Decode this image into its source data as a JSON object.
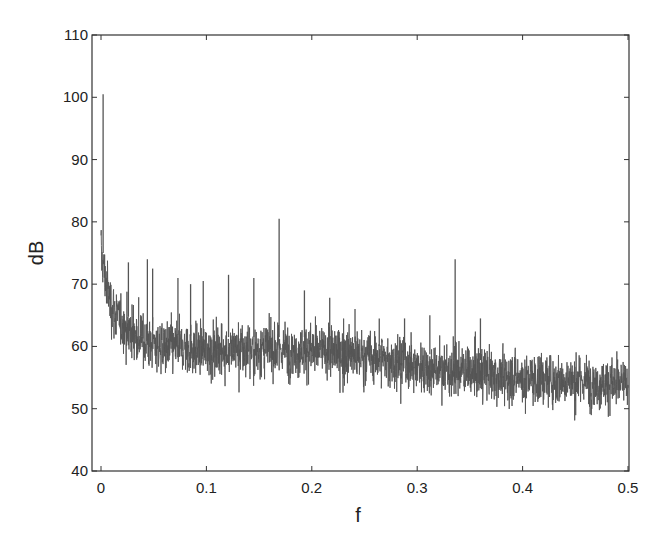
{
  "chart_data": {
    "type": "line",
    "title": "",
    "xlabel": "f",
    "ylabel": "dB",
    "xlim": [
      0,
      0.5
    ],
    "ylim": [
      40,
      110
    ],
    "grid": false,
    "legend": null,
    "x_ticks": [
      "0",
      "0.1",
      "0.2",
      "0.3",
      "0.4",
      "0.5"
    ],
    "y_ticks": [
      "40",
      "50",
      "60",
      "70",
      "80",
      "90",
      "100",
      "110"
    ],
    "line_color": "#555555",
    "baseline_trend": {
      "f": [
        0.0,
        0.005,
        0.01,
        0.02,
        0.04,
        0.06,
        0.1,
        0.15,
        0.2,
        0.25,
        0.3,
        0.35,
        0.4,
        0.45,
        0.5
      ],
      "center_db": [
        75,
        70,
        66.5,
        63.5,
        61,
        60,
        59.5,
        59.5,
        59.5,
        58.5,
        57,
        56,
        55,
        54.5,
        54
      ],
      "spread_db": [
        4,
        4,
        4,
        4,
        4,
        4,
        4,
        4,
        4,
        4,
        3.8,
        3.8,
        3.8,
        3.8,
        3.8
      ]
    },
    "peaks": [
      {
        "f": 0.002,
        "db": 100.5
      },
      {
        "f": 0.026,
        "db": 73.5
      },
      {
        "f": 0.044,
        "db": 74.0
      },
      {
        "f": 0.049,
        "db": 72.5
      },
      {
        "f": 0.073,
        "db": 71.0
      },
      {
        "f": 0.085,
        "db": 70.0
      },
      {
        "f": 0.097,
        "db": 70.5
      },
      {
        "f": 0.121,
        "db": 71.5
      },
      {
        "f": 0.145,
        "db": 71.0
      },
      {
        "f": 0.169,
        "db": 80.5
      },
      {
        "f": 0.193,
        "db": 69.0
      },
      {
        "f": 0.217,
        "db": 67.8
      },
      {
        "f": 0.241,
        "db": 66.0
      },
      {
        "f": 0.264,
        "db": 64.5
      },
      {
        "f": 0.288,
        "db": 64.5
      },
      {
        "f": 0.312,
        "db": 65.0
      },
      {
        "f": 0.336,
        "db": 74.0
      },
      {
        "f": 0.36,
        "db": 64.5
      }
    ]
  }
}
